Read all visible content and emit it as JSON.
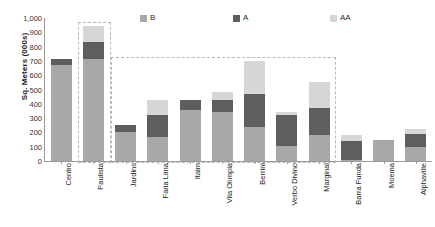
{
  "chart_data": {
    "type": "bar",
    "stacked": true,
    "title": "",
    "xlabel": "",
    "ylabel": "Sq. Meters (000s)",
    "ylim": [
      0,
      1000
    ],
    "ytick_step": 100,
    "ytick_labels": [
      "1,000",
      "900",
      "800",
      "700",
      "600",
      "500",
      "400",
      "300",
      "200",
      "100",
      "0"
    ],
    "grid": false,
    "legend_position": "top",
    "legend": [
      "B",
      "A",
      "AA"
    ],
    "series_colors": {
      "B": "#a8a8a8",
      "A": "#5e5e5e",
      "AA": "#d6d6d6"
    },
    "categories": [
      "Centro",
      "Paulista",
      "Jardins",
      "Faria Lima",
      "Itaim",
      "Vila Olímpia",
      "Berrini",
      "Verbo Divino",
      "Marginal",
      "Barra Funda",
      "Moema",
      "Alphaville"
    ],
    "series": [
      {
        "name": "B",
        "values": [
          670,
          710,
          200,
          170,
          355,
          345,
          240,
          105,
          185,
          10,
          150,
          95
        ]
      },
      {
        "name": "A",
        "values": [
          40,
          125,
          55,
          150,
          75,
          85,
          230,
          215,
          185,
          130,
          0,
          95
        ]
      },
      {
        "name": "AA",
        "values": [
          0,
          110,
          0,
          110,
          0,
          55,
          230,
          20,
          185,
          45,
          0,
          35
        ]
      }
    ],
    "totals": [
      710,
      945,
      255,
      430,
      430,
      485,
      700,
      340,
      555,
      185,
      150,
      225
    ],
    "annotations": [
      {
        "type": "dashed-box",
        "label": "paulista-highlight",
        "categories": [
          "Paulista"
        ]
      },
      {
        "type": "dashed-box",
        "label": "expanded-area-highlight",
        "categories": [
          "Jardins",
          "Faria Lima",
          "Itaim",
          "Vila Olímpia",
          "Berrini",
          "Verbo Divino",
          "Marginal"
        ]
      }
    ]
  },
  "legend": {
    "items": [
      {
        "label": "B",
        "color": "#a8a8a8"
      },
      {
        "label": "A",
        "color": "#5e5e5e"
      },
      {
        "label": "AA",
        "color": "#d6d6d6"
      }
    ]
  },
  "axis": {
    "y_title": "Sq. Meters (000s)",
    "y_ticks": [
      "1,000",
      "900",
      "800",
      "700",
      "600",
      "500",
      "400",
      "300",
      "200",
      "100",
      "0"
    ]
  },
  "categories": [
    "Centro",
    "Paulista",
    "Jardins",
    "Faria Lima",
    "Itaim",
    "Vila Olímpia",
    "Berrini",
    "Verbo Divino",
    "Marginal",
    "Barra Funda",
    "Moema",
    "Alphaville"
  ]
}
